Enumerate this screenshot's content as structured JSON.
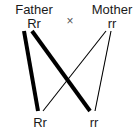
{
  "diagram": {
    "kind": "genetic-cross-diagram",
    "background_color": "#ffffff",
    "line_color": "#000000",
    "text_color": "#1a1a1a",
    "cross_symbol": "×",
    "parents": [
      {
        "name": "Father",
        "genotype": "Rr",
        "side": "left"
      },
      {
        "name": "Mother",
        "genotype": "rr",
        "side": "right"
      }
    ],
    "offspring": [
      {
        "genotype": "Rr",
        "side": "left"
      },
      {
        "genotype": "rr",
        "side": "right"
      }
    ],
    "links": [
      {
        "from": "father",
        "to": "offspring-left",
        "weight": "thick",
        "stroke_width": 4
      },
      {
        "from": "father",
        "to": "offspring-right",
        "weight": "thick",
        "stroke_width": 4
      },
      {
        "from": "mother",
        "to": "offspring-left",
        "weight": "thin",
        "stroke_width": 1
      },
      {
        "from": "mother",
        "to": "offspring-right",
        "weight": "thin",
        "stroke_width": 1
      }
    ]
  }
}
